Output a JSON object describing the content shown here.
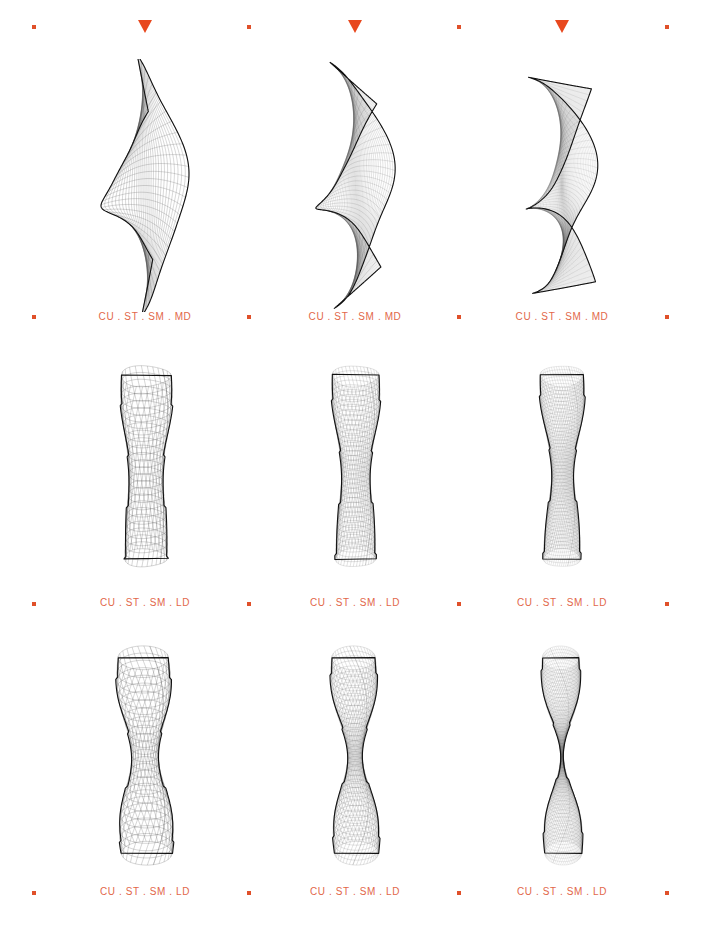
{
  "page": {
    "width": 702,
    "height": 944,
    "background": "#ffffff",
    "accent_color": "#e8481e",
    "caption_color": "#e2674a",
    "mesh_line_color": "#4a4a4a",
    "mesh_outline_color": "#111111"
  },
  "marker_rows": [
    {
      "y": 18,
      "markers": [
        {
          "type": "dot",
          "icon": "dot-marker-icon",
          "x": 34
        },
        {
          "type": "triangle",
          "icon": "triangle-down-icon",
          "x": 145
        },
        {
          "type": "dot",
          "icon": "dot-marker-icon",
          "x": 249
        },
        {
          "type": "triangle",
          "icon": "triangle-down-icon",
          "x": 355
        },
        {
          "type": "dot",
          "icon": "dot-marker-icon",
          "x": 459
        },
        {
          "type": "triangle",
          "icon": "triangle-down-icon",
          "x": 562
        },
        {
          "type": "dot",
          "icon": "dot-marker-icon",
          "x": 667
        }
      ]
    },
    {
      "y": 308,
      "markers": [
        {
          "type": "dot",
          "icon": "dot-marker-icon",
          "x": 34
        },
        {
          "type": "dot",
          "icon": "dot-marker-icon",
          "x": 249
        },
        {
          "type": "dot",
          "icon": "dot-marker-icon",
          "x": 459
        },
        {
          "type": "dot",
          "icon": "dot-marker-icon",
          "x": 667
        }
      ]
    },
    {
      "y": 595,
      "markers": [
        {
          "type": "dot",
          "icon": "dot-marker-icon",
          "x": 34
        },
        {
          "type": "dot",
          "icon": "dot-marker-icon",
          "x": 249
        },
        {
          "type": "dot",
          "icon": "dot-marker-icon",
          "x": 459
        },
        {
          "type": "dot",
          "icon": "dot-marker-icon",
          "x": 667
        }
      ]
    },
    {
      "y": 884,
      "markers": [
        {
          "type": "dot",
          "icon": "dot-marker-icon",
          "x": 34
        },
        {
          "type": "dot",
          "icon": "dot-marker-icon",
          "x": 249
        },
        {
          "type": "dot",
          "icon": "dot-marker-icon",
          "x": 459
        },
        {
          "type": "dot",
          "icon": "dot-marker-icon",
          "x": 667
        }
      ]
    }
  ],
  "caption_rows": [
    {
      "y": 311,
      "captions": [
        {
          "x": 145,
          "text": "CU . ST . SM . MD"
        },
        {
          "x": 355,
          "text": "CU . ST . SM . MD"
        },
        {
          "x": 562,
          "text": "CU . ST . SM . MD"
        }
      ]
    },
    {
      "y": 597,
      "captions": [
        {
          "x": 145,
          "text": "CU . ST . SM . LD"
        },
        {
          "x": 355,
          "text": "CU . ST . SM . LD"
        },
        {
          "x": 562,
          "text": "CU . ST . SM . LD"
        }
      ]
    },
    {
      "y": 886,
      "captions": [
        {
          "x": 145,
          "text": "CU . ST . SM . LD"
        },
        {
          "x": 355,
          "text": "CU . ST . SM . LD"
        },
        {
          "x": 562,
          "text": "CU . ST . SM . LD"
        }
      ]
    }
  ],
  "chart_data": {
    "type": "line",
    "title": "",
    "subtitle": "",
    "xlabel": "",
    "ylabel": "",
    "grid": false,
    "legend_position": "none",
    "layout": {
      "rows": 3,
      "cols": 3
    },
    "panels": [
      {
        "row": 1,
        "col": 1,
        "label": "CU . ST . SM . MD",
        "family": "saddle-sheet",
        "u_lines": 30,
        "v_lines": 30,
        "twist": 1.0,
        "pinch": 0.45,
        "center_x": 145,
        "center_y": 185,
        "width": 110,
        "height": 225
      },
      {
        "row": 1,
        "col": 2,
        "label": "CU . ST . SM . MD",
        "family": "saddle-sheet",
        "u_lines": 44,
        "v_lines": 44,
        "twist": 1.35,
        "pinch": 0.62,
        "center_x": 355,
        "center_y": 185,
        "width": 105,
        "height": 225
      },
      {
        "row": 1,
        "col": 3,
        "label": "CU . ST . SM . MD",
        "family": "saddle-sheet",
        "u_lines": 60,
        "v_lines": 60,
        "twist": 1.7,
        "pinch": 0.8,
        "center_x": 562,
        "center_y": 185,
        "width": 100,
        "height": 225
      },
      {
        "row": 2,
        "col": 1,
        "label": "CU . ST . SM . LD",
        "family": "column-lattice",
        "u_lines": 26,
        "v_lines": 26,
        "twist": 0.6,
        "pinch": 0.22,
        "center_x": 145,
        "center_y": 467,
        "width": 88,
        "height": 200
      },
      {
        "row": 2,
        "col": 2,
        "label": "CU . ST . SM . LD",
        "family": "column-lattice",
        "u_lines": 38,
        "v_lines": 38,
        "twist": 0.8,
        "pinch": 0.3,
        "center_x": 355,
        "center_y": 467,
        "width": 82,
        "height": 200
      },
      {
        "row": 2,
        "col": 3,
        "label": "CU . ST . SM . LD",
        "family": "column-lattice",
        "u_lines": 52,
        "v_lines": 52,
        "twist": 1.0,
        "pinch": 0.42,
        "center_x": 562,
        "center_y": 467,
        "width": 76,
        "height": 200
      },
      {
        "row": 3,
        "col": 1,
        "label": "CU . ST . SM . LD",
        "family": "hourglass-lattice",
        "u_lines": 26,
        "v_lines": 26,
        "twist": 0.9,
        "pinch": 0.45,
        "center_x": 145,
        "center_y": 755,
        "width": 90,
        "height": 215
      },
      {
        "row": 3,
        "col": 2,
        "label": "CU . ST . SM . LD",
        "family": "hourglass-lattice",
        "u_lines": 38,
        "v_lines": 38,
        "twist": 1.2,
        "pinch": 0.65,
        "center_x": 355,
        "center_y": 755,
        "width": 78,
        "height": 215
      },
      {
        "row": 3,
        "col": 3,
        "label": "CU . ST . SM . LD",
        "family": "hourglass-lattice",
        "u_lines": 56,
        "v_lines": 56,
        "twist": 1.5,
        "pinch": 0.92,
        "center_x": 562,
        "center_y": 755,
        "width": 66,
        "height": 215
      }
    ]
  }
}
